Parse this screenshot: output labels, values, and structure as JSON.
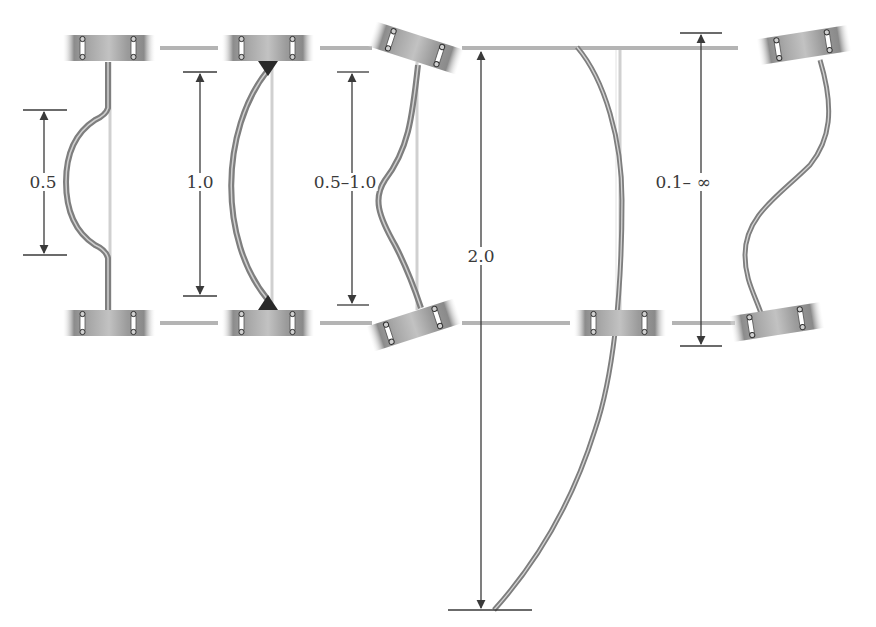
{
  "diagram": {
    "type": "column-buckling-effective-length-factors",
    "colors": {
      "background": "#ffffff",
      "column": "#8a8a8a",
      "column_highlight": "#d8d8d8",
      "reference_line": "#b4b4b4",
      "dimension_line": "#3a3a3a",
      "support_block": "#9a9a9a",
      "pin": "#2a2a2a"
    },
    "cases": [
      {
        "id": "fixed-fixed",
        "k_label": "0.5"
      },
      {
        "id": "pinned-pinned",
        "k_label": "1.0"
      },
      {
        "id": "fixed-rotating",
        "k_label": "0.5–1.0"
      },
      {
        "id": "fixed-free",
        "k_label": "2.0"
      },
      {
        "id": "sway-rotating",
        "k_label": "0.1– ∞"
      }
    ]
  }
}
